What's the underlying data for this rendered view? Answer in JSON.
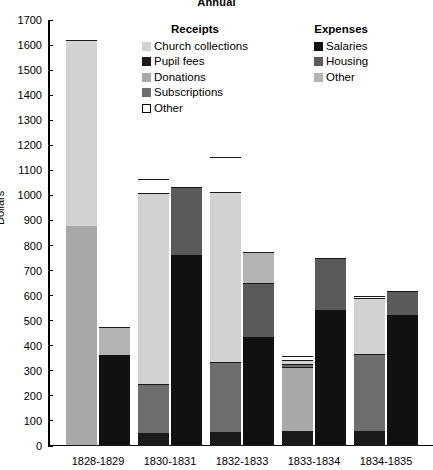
{
  "title": "Annual",
  "axis": {
    "ylabel": "Dollars",
    "yticks": [
      0,
      100,
      200,
      300,
      400,
      500,
      600,
      700,
      800,
      900,
      1000,
      1100,
      1200,
      1300,
      1400,
      1500,
      1600,
      1700
    ],
    "ymin": 0,
    "ymax": 1700
  },
  "legend": {
    "receipts": {
      "title": "Receipts",
      "items": [
        {
          "label": "Church collections",
          "color": "#d2d2d2",
          "swatch": "solid"
        },
        {
          "label": "Pupil fees",
          "color": "#1a1a1a",
          "swatch": "solid"
        },
        {
          "label": "Donations",
          "color": "#a8a8a8",
          "swatch": "solid"
        },
        {
          "label": "Subscriptions",
          "color": "#6e6e6e",
          "swatch": "solid"
        },
        {
          "label": "Other",
          "color": "#ffffff",
          "swatch": "outline"
        }
      ]
    },
    "expenses": {
      "title": "Expenses",
      "items": [
        {
          "label": "Salaries",
          "color": "#111111",
          "swatch": "solid"
        },
        {
          "label": "Housing",
          "color": "#5a5a5a",
          "swatch": "solid"
        },
        {
          "label": "Other",
          "color": "#b4b4b4",
          "swatch": "solid"
        }
      ]
    }
  },
  "chart_data": {
    "type": "bar",
    "title": "Annual",
    "xlabel": "",
    "ylabel": "Dollars",
    "ylim": [
      0,
      1700
    ],
    "grid": false,
    "legend_position": "inside-top",
    "stacked": true,
    "categories": [
      "1828-1829",
      "1830-1831",
      "1832-1833",
      "1833-1834",
      "1834-1835"
    ],
    "bar_groups": [
      {
        "name": "Receipts",
        "series": [
          {
            "name": "Pupil fees",
            "color": "#1a1a1a",
            "values": [
              0,
              50,
              50,
              55,
              55
            ]
          },
          {
            "name": "Subscriptions",
            "color": "#6e6e6e",
            "values": [
              0,
              195,
              280,
              0,
              310
            ]
          },
          {
            "name": "Donations",
            "color": "#a8a8a8",
            "values": [
              875,
              0,
              0,
              255,
              0
            ]
          },
          {
            "name": "Church collections",
            "color": "#d2d2d2",
            "values": [
              740,
              760,
              680,
              0,
              220
            ]
          },
          {
            "name": "Other",
            "color": "#ffffff",
            "values": [
              0,
              55,
              140,
              45,
              10
            ]
          }
        ],
        "totals": [
          1615,
          1060,
          1150,
          355,
          595
        ]
      },
      {
        "name": "Expenses",
        "series": [
          {
            "name": "Salaries",
            "color": "#111111",
            "values": [
              360,
              760,
              430,
              540,
              520
            ]
          },
          {
            "name": "Housing",
            "color": "#5a5a5a",
            "values": [
              0,
              270,
              215,
              205,
              95
            ]
          },
          {
            "name": "Other",
            "color": "#b4b4b4",
            "values": [
              110,
              0,
              125,
              0,
              0
            ]
          }
        ],
        "totals": [
          470,
          1030,
          770,
          745,
          615
        ]
      }
    ]
  },
  "render": {
    "groups": [
      {
        "category": "1828-1829",
        "left": 18,
        "receipts": [
          {
            "seg": "Donations",
            "from": 0,
            "to": 875,
            "color": "#a8a8a8"
          },
          {
            "seg": "Church collections",
            "from": 875,
            "to": 1615,
            "color": "#d2d2d2"
          }
        ],
        "expenses": [
          {
            "seg": "Salaries",
            "from": 0,
            "to": 360,
            "color": "#111111"
          },
          {
            "seg": "Other",
            "from": 360,
            "to": 470,
            "color": "#b4b4b4"
          }
        ]
      },
      {
        "category": "1830-1831",
        "left": 90,
        "receipts": [
          {
            "seg": "Pupil fees",
            "from": 0,
            "to": 48,
            "color": "#1a1a1a"
          },
          {
            "seg": "Subscriptions",
            "from": 48,
            "to": 243,
            "color": "#6e6e6e"
          },
          {
            "seg": "Church collections",
            "from": 243,
            "to": 1005,
            "color": "#d2d2d2"
          },
          {
            "seg": "Other",
            "from": 1005,
            "to": 1060,
            "color": "#ffffff"
          }
        ],
        "expenses": [
          {
            "seg": "Salaries",
            "from": 0,
            "to": 760,
            "color": "#111111"
          },
          {
            "seg": "Housing",
            "from": 760,
            "to": 1030,
            "color": "#5a5a5a"
          }
        ]
      },
      {
        "category": "1832-1833",
        "left": 162,
        "receipts": [
          {
            "seg": "Pupil fees",
            "from": 0,
            "to": 50,
            "color": "#1a1a1a"
          },
          {
            "seg": "Subscriptions",
            "from": 50,
            "to": 330,
            "color": "#6e6e6e"
          },
          {
            "seg": "Church collections",
            "from": 330,
            "to": 1010,
            "color": "#d2d2d2"
          },
          {
            "seg": "Other",
            "from": 1010,
            "to": 1150,
            "color": "#ffffff"
          }
        ],
        "expenses": [
          {
            "seg": "Salaries",
            "from": 0,
            "to": 430,
            "color": "#111111"
          },
          {
            "seg": "Housing",
            "from": 430,
            "to": 645,
            "color": "#5a5a5a"
          },
          {
            "seg": "Other",
            "from": 645,
            "to": 770,
            "color": "#b4b4b4"
          }
        ]
      },
      {
        "category": "1833-1834",
        "left": 234,
        "receipts": [
          {
            "seg": "Pupil fees",
            "from": 0,
            "to": 55,
            "color": "#1a1a1a"
          },
          {
            "seg": "Donations",
            "from": 55,
            "to": 310,
            "color": "#a8a8a8"
          },
          {
            "seg": "Subscriptions",
            "from": 310,
            "to": 325,
            "color": "#6e6e6e"
          },
          {
            "seg": "Church collections",
            "from": 325,
            "to": 340,
            "color": "#d2d2d2"
          },
          {
            "seg": "Other",
            "from": 340,
            "to": 355,
            "color": "#ffffff"
          }
        ],
        "expenses": [
          {
            "seg": "Salaries",
            "from": 0,
            "to": 540,
            "color": "#111111"
          },
          {
            "seg": "Housing",
            "from": 540,
            "to": 745,
            "color": "#5a5a5a"
          }
        ]
      },
      {
        "category": "1834-1835",
        "left": 306,
        "receipts": [
          {
            "seg": "Pupil fees",
            "from": 0,
            "to": 55,
            "color": "#1a1a1a"
          },
          {
            "seg": "Subscriptions",
            "from": 55,
            "to": 365,
            "color": "#6e6e6e"
          },
          {
            "seg": "Church collections",
            "from": 365,
            "to": 585,
            "color": "#d2d2d2"
          },
          {
            "seg": "Other",
            "from": 585,
            "to": 595,
            "color": "#ffffff"
          }
        ],
        "expenses": [
          {
            "seg": "Salaries",
            "from": 0,
            "to": 520,
            "color": "#111111"
          },
          {
            "seg": "Housing",
            "from": 520,
            "to": 615,
            "color": "#5a5a5a"
          }
        ]
      }
    ]
  }
}
